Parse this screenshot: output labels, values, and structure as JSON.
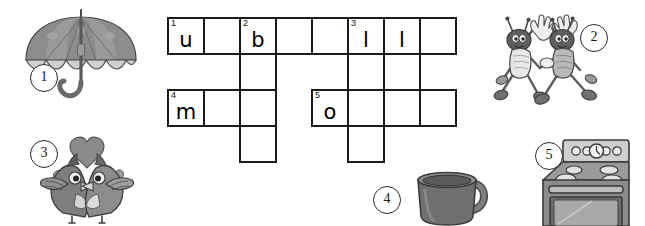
{
  "worksheet": {
    "type": "picture-crossword-puzzle",
    "background_color": "#ffffff",
    "grid_line_color": "#1b1b1b",
    "cell_size_px": 38
  },
  "crossword": {
    "columns": 8,
    "rows": 4,
    "cells": [
      {
        "row": 0,
        "col": 0,
        "number": "1",
        "letter": "u"
      },
      {
        "row": 0,
        "col": 1,
        "number": "",
        "letter": ""
      },
      {
        "row": 0,
        "col": 2,
        "number": "2",
        "letter": "b"
      },
      {
        "row": 0,
        "col": 3,
        "number": "",
        "letter": ""
      },
      {
        "row": 0,
        "col": 4,
        "number": "",
        "letter": ""
      },
      {
        "row": 0,
        "col": 5,
        "number": "3",
        "letter": "l"
      },
      {
        "row": 0,
        "col": 6,
        "number": "",
        "letter": "l"
      },
      {
        "row": 0,
        "col": 7,
        "number": "",
        "letter": ""
      },
      {
        "row": 1,
        "col": 2,
        "number": "",
        "letter": ""
      },
      {
        "row": 1,
        "col": 5,
        "number": "",
        "letter": ""
      },
      {
        "row": 1,
        "col": 6,
        "number": "",
        "letter": ""
      },
      {
        "row": 2,
        "col": 0,
        "number": "4",
        "letter": "m"
      },
      {
        "row": 2,
        "col": 1,
        "number": "",
        "letter": ""
      },
      {
        "row": 2,
        "col": 2,
        "number": "",
        "letter": ""
      },
      {
        "row": 2,
        "col": 4,
        "number": "5",
        "letter": "o"
      },
      {
        "row": 2,
        "col": 5,
        "number": "",
        "letter": ""
      },
      {
        "row": 2,
        "col": 6,
        "number": "",
        "letter": ""
      },
      {
        "row": 2,
        "col": 7,
        "number": "",
        "letter": ""
      },
      {
        "row": 3,
        "col": 2,
        "number": "",
        "letter": ""
      },
      {
        "row": 3,
        "col": 5,
        "number": "",
        "letter": ""
      }
    ]
  },
  "pictures": [
    {
      "id": "umbrella",
      "number": "1",
      "label": "umbrella"
    },
    {
      "id": "bugs",
      "number": "2",
      "label": "beetles"
    },
    {
      "id": "birds",
      "number": "3",
      "label": "lovebirds"
    },
    {
      "id": "mug",
      "number": "4",
      "label": "mug"
    },
    {
      "id": "stove",
      "number": "5",
      "label": "stove"
    }
  ],
  "colors": {
    "ink": "#1b1b1b",
    "gray_dark": "#6e6e6e",
    "gray_mid": "#9a9a9a",
    "gray_light": "#c8c8c8",
    "gray_pale": "#e2e2e2"
  }
}
